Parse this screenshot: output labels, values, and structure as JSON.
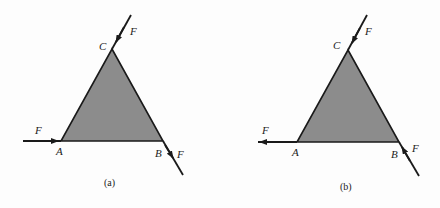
{
  "colors": {
    "background": "#fdfdfd",
    "triangle_fill": "#8c8c8c",
    "stroke": "#1a1a1a"
  },
  "panels": [
    {
      "caption": "(a)",
      "vertices": {
        "A": "A",
        "B": "B",
        "C": "C"
      },
      "forces": [
        {
          "label": "F",
          "at": "A",
          "direction": "toward vertex (pointing right)"
        },
        {
          "label": "F",
          "at": "B",
          "direction": "away from vertex (pointing down-right)"
        },
        {
          "label": "F",
          "at": "C",
          "direction": "toward vertex (pointing down-left)"
        }
      ]
    },
    {
      "caption": "(b)",
      "vertices": {
        "A": "A",
        "B": "B",
        "C": "C"
      },
      "forces": [
        {
          "label": "F",
          "at": "A",
          "direction": "away from vertex (pointing left)"
        },
        {
          "label": "F",
          "at": "B",
          "direction": "toward vertex (pointing up-left)"
        },
        {
          "label": "F",
          "at": "C",
          "direction": "toward vertex (pointing down-left)"
        }
      ]
    }
  ]
}
